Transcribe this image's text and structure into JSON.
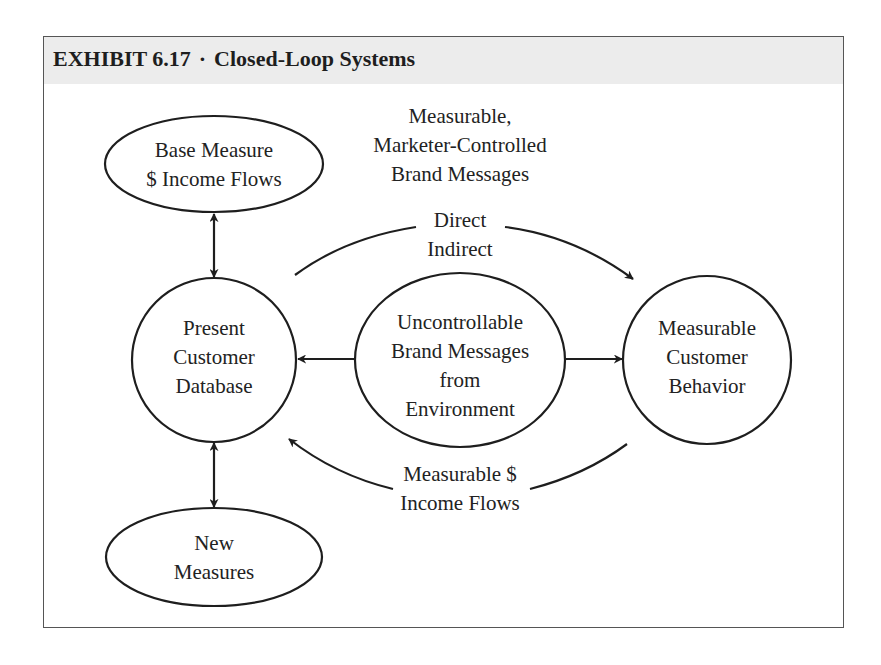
{
  "exhibit": {
    "label": "EXHIBIT 6.17",
    "separator": "·",
    "title": "Closed-Loop Systems"
  },
  "nodes": {
    "base_measure": {
      "lines": [
        "Base Measure",
        "$ Income Flows"
      ]
    },
    "present_db": {
      "lines": [
        "Present",
        "Customer",
        "Database"
      ]
    },
    "new_measures": {
      "lines": [
        "New",
        "Measures"
      ]
    },
    "uncontrollable": {
      "lines": [
        "Uncontrollable",
        "Brand Messages",
        "from",
        "Environment"
      ]
    },
    "customer_behavior": {
      "lines": [
        "Measurable",
        "Customer",
        "Behavior"
      ]
    }
  },
  "labels": {
    "top_caption": [
      "Measurable,",
      "Marketer-Controlled",
      "Brand Messages"
    ],
    "top_arc": [
      "Direct",
      "Indirect"
    ],
    "bottom_arc": [
      "Measurable $",
      "Income Flows"
    ]
  },
  "colors": {
    "stroke": "#1e1e1e",
    "header_band": "#ececec"
  }
}
